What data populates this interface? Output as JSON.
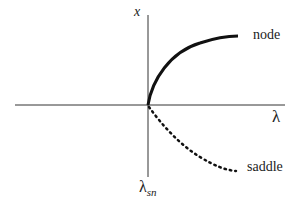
{
  "diagram": {
    "axes": {
      "vertical_label": "x",
      "horizontal_label": "λ",
      "origin_label_main": "λ",
      "origin_label_sub": "sn"
    },
    "branches": [
      {
        "name": "node",
        "style": "solid",
        "label": "node"
      },
      {
        "name": "saddle",
        "style": "dotted",
        "label": "saddle"
      }
    ],
    "colors": {
      "line": "#111111",
      "axis": "#333333",
      "background": "#ffffff"
    }
  }
}
